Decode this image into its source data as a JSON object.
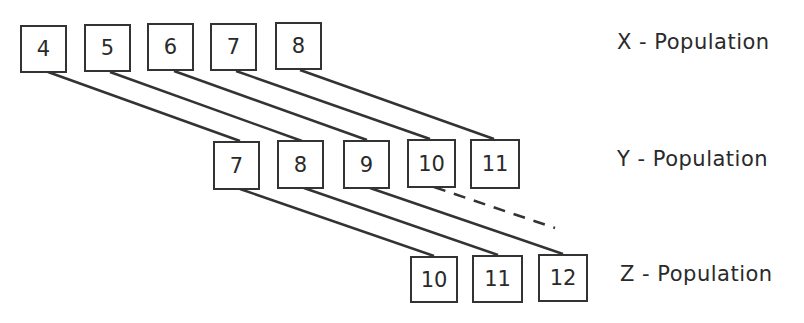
{
  "diagram": {
    "rows": [
      {
        "name": "X",
        "label": "X - Population",
        "values": [
          "4",
          "5",
          "6",
          "7",
          "8"
        ]
      },
      {
        "name": "Y",
        "label": "Y - Population",
        "values": [
          "7",
          "8",
          "9",
          "10",
          "11"
        ]
      },
      {
        "name": "Z",
        "label": "Z - Population",
        "values": [
          "10",
          "11",
          "12"
        ]
      }
    ],
    "connections": [
      {
        "from": "X:4",
        "to": "Y:7",
        "style": "solid"
      },
      {
        "from": "X:5",
        "to": "Y:8",
        "style": "solid"
      },
      {
        "from": "X:6",
        "to": "Y:9",
        "style": "solid"
      },
      {
        "from": "X:7",
        "to": "Y:10",
        "style": "solid"
      },
      {
        "from": "X:8",
        "to": "Y:11",
        "style": "solid"
      },
      {
        "from": "Y:7",
        "to": "Z:10",
        "style": "solid"
      },
      {
        "from": "Y:8",
        "to": "Z:11",
        "style": "solid"
      },
      {
        "from": "Y:9",
        "to": "Z:12",
        "style": "solid"
      },
      {
        "from": "Y:10",
        "to": "(beyond)",
        "style": "dashed"
      }
    ],
    "colors": {
      "ink": "#333333",
      "background": "#ffffff"
    }
  }
}
